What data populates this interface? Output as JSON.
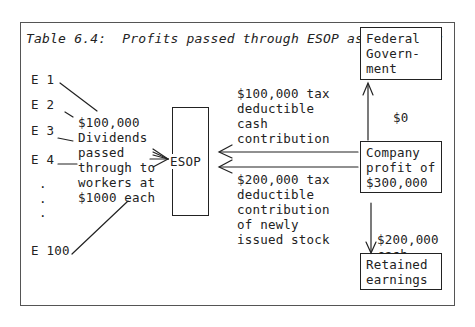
{
  "title": "Table 6.4:  Profits passed through ESOP as dividends",
  "employees": [
    "E 1",
    "E 2",
    "E 3",
    "E 4",
    ".",
    ".",
    ".",
    "E 100"
  ],
  "dividend_label": "$100,000\nDividends\npassed\nthrough to\nworkers at\n$1000 each",
  "esop_box": "ESOP",
  "cash_contribution_label": "$100,000 tax\ndeductible\ncash\ncontribution",
  "stock_contribution_label": "$200,000 tax\ndeductible\ncontribution\nof newly\nissued stock",
  "federal_box": "Federal\nGovern-\nment",
  "tax_label": "$0",
  "company_box": "Company\nprofit of\n$300,000",
  "retained_cash_label": "$200,000\ncash",
  "retained_box": "Retained\nearnings"
}
